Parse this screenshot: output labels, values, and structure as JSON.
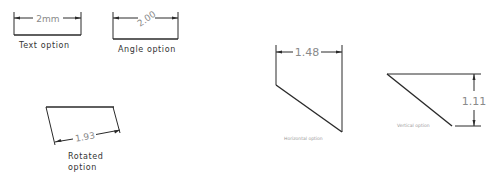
{
  "diagram": {
    "examples": [
      {
        "id": "text",
        "dimension_value": "2mm",
        "label": "Text option"
      },
      {
        "id": "angle",
        "dimension_value": "2.00",
        "label": "Angle option"
      },
      {
        "id": "rotated",
        "dimension_value": "1.93",
        "label_line1": "Rotated",
        "label_line2": "option"
      },
      {
        "id": "horizontal",
        "dimension_value": "1.48",
        "label": "Horizontal option"
      },
      {
        "id": "vertical",
        "dimension_value": "1.11",
        "label": "Vertical option"
      }
    ]
  }
}
